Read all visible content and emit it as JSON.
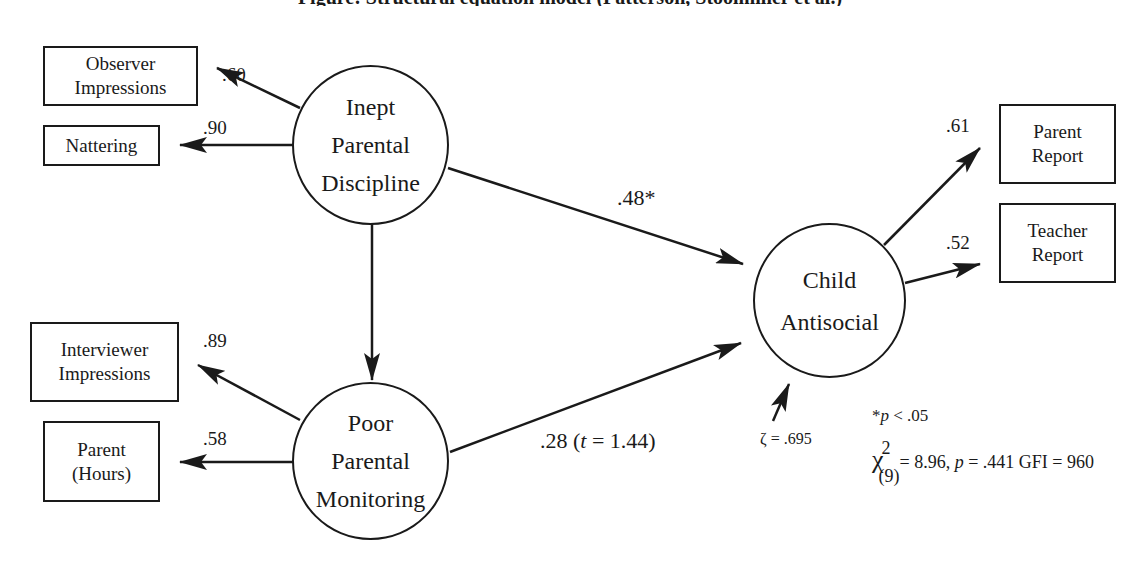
{
  "title_clipped": "Figure: Structural equation model (Patterson, Stoolmiller et al.)",
  "latent_variables": [
    {
      "id": "ipd",
      "label": "Inept\nParental\nDiscipline"
    },
    {
      "id": "ppm",
      "label": "Poor\nParental\nMonitoring"
    },
    {
      "id": "ca",
      "label": "Child\nAntisocial"
    }
  ],
  "indicators": [
    {
      "id": "obs",
      "label": "Observer\nImpressions",
      "loading": ".60",
      "latent": "ipd"
    },
    {
      "id": "nat",
      "label": "Nattering",
      "loading": ".90",
      "latent": "ipd"
    },
    {
      "id": "int",
      "label": "Interviewer\nImpressions",
      "loading": ".89",
      "latent": "ppm"
    },
    {
      "id": "par",
      "label": "Parent\n(Hours)",
      "loading": ".58",
      "latent": "ppm"
    },
    {
      "id": "prep",
      "label": "Parent\nReport",
      "loading": ".61",
      "latent": "ca"
    },
    {
      "id": "trep",
      "label": "Teacher\nReport",
      "loading": ".52",
      "latent": "ca"
    }
  ],
  "paths": [
    {
      "from": "ipd",
      "to": "ca",
      "label": ".48*"
    },
    {
      "from": "ppm",
      "to": "ca",
      "label_coef": ".28 (",
      "label_t": "t",
      "label_rest": " = 1.44)"
    },
    {
      "from": "ipd",
      "to": "ppm",
      "label": ""
    }
  ],
  "disturbance": {
    "label": "ζ = .695"
  },
  "notes": {
    "significance_star": "*",
    "significance_p": "p",
    "significance_rest": " < .05",
    "chi_symbol": "χ",
    "chi_sup": "2",
    "chi_sub": "(9)",
    "chi_value": "= 8.96, ",
    "p_symbol": "p",
    "p_value": " = .441 GFI = 960"
  }
}
